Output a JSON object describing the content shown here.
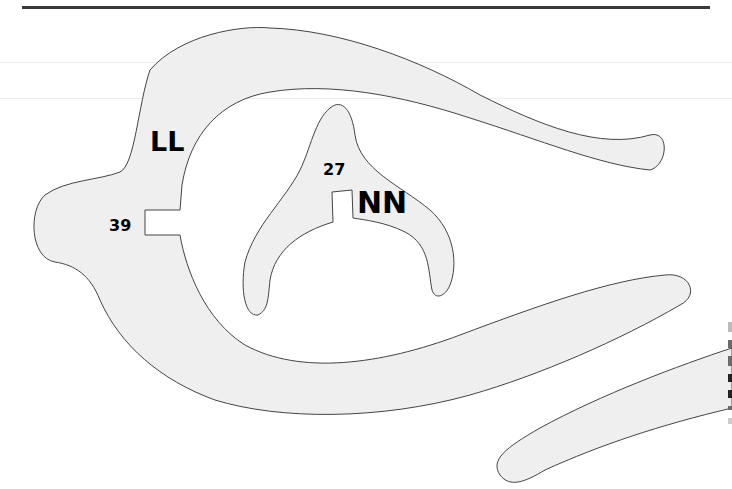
{
  "diagram": {
    "labels": {
      "ll": "LL",
      "n39": "39",
      "n27": "27",
      "nn": "NN"
    },
    "shapes": [
      {
        "id": "outer-arc-piece",
        "label": "LL",
        "number": "39"
      },
      {
        "id": "inner-y-piece",
        "label": "NN",
        "number": "27"
      },
      {
        "id": "lower-right-strip"
      }
    ],
    "colors": {
      "fill": "#efefef",
      "stroke": "#444444",
      "text": "#000000",
      "rule": "#3a3a3a"
    }
  }
}
